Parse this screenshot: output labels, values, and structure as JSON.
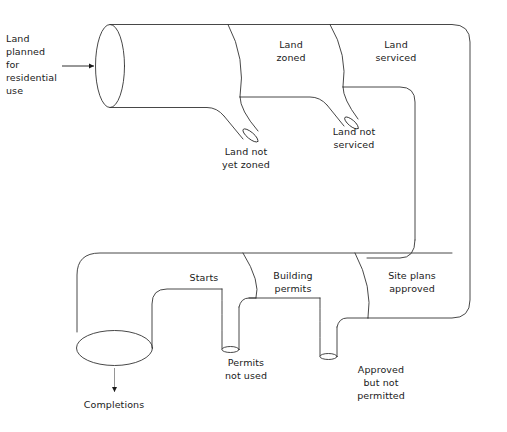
{
  "diagram": {
    "type": "pipe-flow-diagram",
    "stroke_color": "#333333",
    "background_color": "#ffffff",
    "inlet": {
      "label": "Land\nplanned\nfor\nresidential\nuse",
      "arrow_icon": "right-arrow-icon"
    },
    "outlet": {
      "label": "Completions",
      "arrow_icon": "down-arrow-icon"
    },
    "segments": [
      {
        "id": "land-zoned",
        "label": "Land\nzoned"
      },
      {
        "id": "land-serviced",
        "label": "Land\nserviced"
      },
      {
        "id": "site-plans-approved",
        "label": "Site plans\napproved"
      },
      {
        "id": "building-permits",
        "label": "Building\npermits"
      },
      {
        "id": "starts",
        "label": "Starts"
      }
    ],
    "leaks": [
      {
        "id": "land-not-yet-zoned",
        "label": "Land not\nyet zoned"
      },
      {
        "id": "land-not-serviced",
        "label": "Land not\nserviced"
      },
      {
        "id": "approved-but-not-permitted",
        "label": "Approved\nbut not\npermitted"
      },
      {
        "id": "permits-not-used",
        "label": "Permits\nnot used"
      }
    ]
  }
}
